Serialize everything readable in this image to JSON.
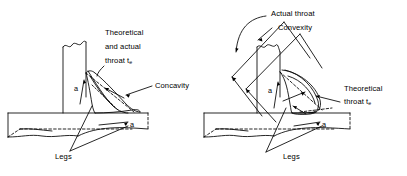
{
  "figure": {
    "background_color": "#ffffff",
    "line_color": "#000000",
    "panels": [
      {
        "id": "left",
        "name": "concave-fillet-weld",
        "description": "Concave fillet weld on a tee joint",
        "labels": {
          "throat_line1": "Theoretical",
          "throat_line2": "and actual",
          "throat_line3": "throat t",
          "throat_subscript": "e",
          "profile": "Concavity",
          "legs": "Legs",
          "leg_vertical": "a",
          "leg_horizontal": "a"
        }
      },
      {
        "id": "right",
        "name": "convex-fillet-weld",
        "description": "Convex fillet weld on a tee joint",
        "labels": {
          "actual_throat": "Actual throat",
          "profile": "Convexity",
          "throat_line1": "Theoretical",
          "throat_line2": "throat t",
          "throat_subscript": "e",
          "legs": "Legs",
          "leg_vertical": "a",
          "leg_horizontal": "a"
        }
      }
    ]
  }
}
